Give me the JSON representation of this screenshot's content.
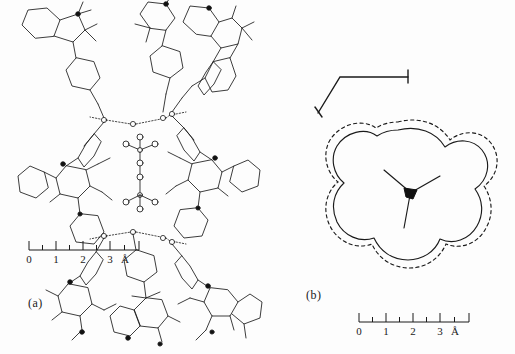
{
  "figure": {
    "background_color": "#fdfdfd",
    "line_color": "#1a1a1a",
    "panels": [
      {
        "id": "a",
        "caption": "(a)",
        "description": "Crystal packing diagram of hydrogen-bonded nitroxide radical host lattice enclosing a guest anion",
        "scalebar": {
          "ticks": [
            "0",
            "1",
            "2",
            "3"
          ],
          "minor_ticks": 7,
          "unit": "Å",
          "length_px": 112
        }
      },
      {
        "id": "b",
        "caption": "(b)",
        "description": "Van der Waals cross-section contour of the trefoil-shaped cavity with inner solid and outer dashed boundary",
        "scalebar": {
          "ticks": [
            "0",
            "1",
            "2",
            "3"
          ],
          "minor_ticks": 7,
          "unit": "Å",
          "length_px": 112
        },
        "axes": {
          "x_label": "x",
          "y_label": "y"
        },
        "contours": [
          {
            "name": "inner-contour",
            "style": "solid"
          },
          {
            "name": "outer-contour",
            "style": "dashed"
          }
        ]
      }
    ]
  }
}
